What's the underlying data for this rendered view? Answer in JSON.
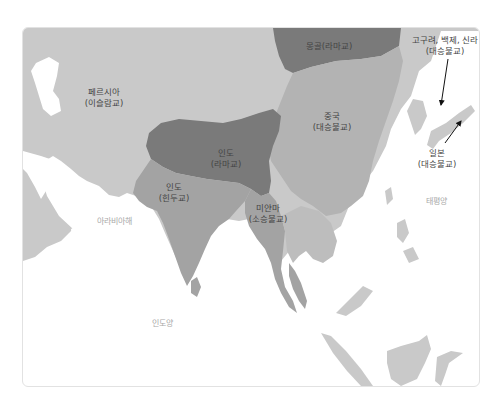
{
  "colors": {
    "land": "#c9c9c9",
    "buddhism_region": "#b0b0b0",
    "lama_region": "#7a7a7a",
    "hindu_region": "#a3a3a3",
    "sea": "#ffffff",
    "sea_label": "#a8a8a8",
    "label": "#444444"
  },
  "regions": [
    {
      "name": "몽골",
      "religion": "(라마교)",
      "combined": "몽골(라마교)"
    },
    {
      "name": "고구려, 백제, 신라",
      "religion": "(대승불교)"
    },
    {
      "name": "페르시아",
      "religion": "(이슬람교)"
    },
    {
      "name": "중국",
      "religion": "(대승불교)"
    },
    {
      "name": "인도",
      "religion": "(라마교)"
    },
    {
      "name": "인도",
      "religion": "(힌두교)"
    },
    {
      "name": "미얀마",
      "religion": "(소승불교)"
    },
    {
      "name": "일본",
      "religion": "(대승불교)"
    }
  ],
  "seas": {
    "arabian_sea": "아라비아해",
    "pacific": "태평양",
    "indian_ocean": "인도양"
  }
}
